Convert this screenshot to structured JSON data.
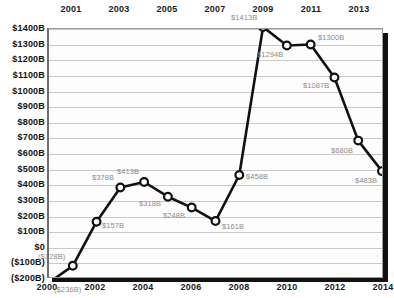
{
  "chart_data": {
    "type": "line",
    "title": "",
    "xlabel": "",
    "ylabel": "",
    "x": [
      2000,
      2001,
      2002,
      2003,
      2004,
      2005,
      2006,
      2007,
      2008,
      2009,
      2010,
      2011,
      2012,
      2013,
      2014
    ],
    "values": [
      -236,
      -128,
      157,
      378,
      413,
      318,
      248,
      161,
      458,
      1413,
      1294,
      1300,
      1087,
      680,
      483
    ],
    "point_labels": [
      "($236B)",
      "($128B)",
      "$157B",
      "$378B",
      "$413B",
      "$318B",
      "$248B",
      "$161B",
      "$458B",
      "$1413B",
      "$1294B",
      "$1300B",
      "$1087B",
      "$680B",
      "$483B"
    ],
    "units": "Billions of dollars",
    "ylim": [
      -200,
      1400
    ],
    "xlim": [
      2000,
      2014
    ],
    "ytick_values": [
      1400,
      1300,
      1200,
      1100,
      1000,
      900,
      800,
      700,
      600,
      500,
      400,
      300,
      200,
      100,
      0,
      -100,
      -200
    ],
    "ytick_labels": [
      "$1400B",
      "$1300B",
      "$1200B",
      "$1100B",
      "$1000B",
      "$900B",
      "$800B",
      "$700B",
      "$600B",
      "$500B",
      "$400B",
      "$300B",
      "$200B",
      "$100B",
      "$0",
      "($100B)",
      "($200B)"
    ],
    "xtick_top_values": [
      2001,
      2003,
      2005,
      2007,
      2009,
      2011,
      2013
    ],
    "xtick_top_labels": [
      "2001",
      "2003",
      "2005",
      "2007",
      "2009",
      "2011",
      "2013"
    ],
    "xtick_bottom_values": [
      2000,
      2002,
      2004,
      2006,
      2008,
      2010,
      2012,
      2014
    ],
    "xtick_bottom_labels": [
      "2000",
      "2002",
      "2004",
      "2006",
      "2008",
      "2010",
      "2012",
      "2014"
    ],
    "grid": true,
    "legend": "none",
    "marker": "circle-open",
    "line_color": "#111111",
    "marker_fill": "#ffffff",
    "label_color": "#8c8c8c",
    "grid_color": "#c9c9c9"
  }
}
